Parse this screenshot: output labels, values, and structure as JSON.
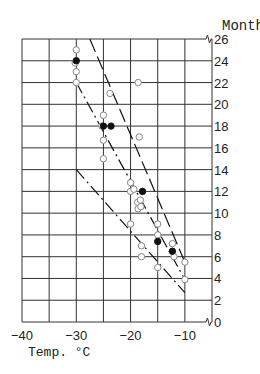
{
  "chart_data": {
    "type": "scatter",
    "title": "",
    "xlabel": "Temp. °C",
    "ylabel": "Months",
    "xlim": [
      -40,
      -5
    ],
    "ylim": [
      0,
      26
    ],
    "x_ticks": [
      -40,
      -30,
      -20,
      -10
    ],
    "x_tick_labels": [
      "−40",
      "−30",
      "−20",
      "−10"
    ],
    "y_ticks": [
      0,
      2,
      4,
      6,
      8,
      10,
      12,
      14,
      16,
      18,
      20,
      22,
      24,
      26
    ],
    "y_tick_labels": [
      "0",
      "2",
      "4",
      "6",
      "8",
      "10",
      "12",
      "14",
      "16",
      "18",
      "20",
      "22",
      "24",
      "26"
    ],
    "grid": true,
    "grid_x_step": 5,
    "grid_y_step": 2,
    "axis_breaks": [
      "y-axis at 26",
      "y-axis at 0"
    ],
    "series": [
      {
        "name": "open circles",
        "marker": "open-circle",
        "points": [
          [
            -30,
            25
          ],
          [
            -30,
            23
          ],
          [
            -30,
            22
          ],
          [
            -30.2,
            23.8
          ],
          [
            -18.6,
            22
          ],
          [
            -23.8,
            21
          ],
          [
            -25,
            19
          ],
          [
            -25.3,
            18
          ],
          [
            -25,
            16.7
          ],
          [
            -25,
            15
          ],
          [
            -18.4,
            17
          ],
          [
            -20,
            12.8
          ],
          [
            -20,
            12
          ],
          [
            -19.4,
            12.2
          ],
          [
            -18.7,
            11
          ],
          [
            -18.2,
            11.2
          ],
          [
            -18.6,
            10.4
          ],
          [
            -18.1,
            10.6
          ],
          [
            -20,
            9
          ],
          [
            -15,
            9
          ],
          [
            -15,
            8
          ],
          [
            -18,
            7
          ],
          [
            -18,
            6
          ],
          [
            -15,
            5
          ],
          [
            -12.3,
            7.2
          ],
          [
            -12,
            6
          ],
          [
            -10,
            5.5
          ],
          [
            -10,
            3.9
          ]
        ]
      },
      {
        "name": "filled circles",
        "marker": "filled-circle",
        "points": [
          [
            -30,
            24
          ],
          [
            -25,
            18
          ],
          [
            -23.6,
            18
          ],
          [
            -17.8,
            12
          ],
          [
            -15,
            7.4
          ],
          [
            -12.3,
            6.5
          ]
        ]
      }
    ],
    "lines": [
      {
        "name": "upper bound",
        "style": "long-dash",
        "from": [
          -27.5,
          26
        ],
        "to": [
          -10,
          5.5
        ]
      },
      {
        "name": "mean",
        "style": "dash-dot",
        "from": [
          -30,
          22
        ],
        "to": [
          -10,
          3.9
        ]
      },
      {
        "name": "lower bound",
        "style": "dash-dot",
        "from": [
          -30,
          14
        ],
        "to": [
          -10,
          2.7
        ]
      }
    ]
  }
}
